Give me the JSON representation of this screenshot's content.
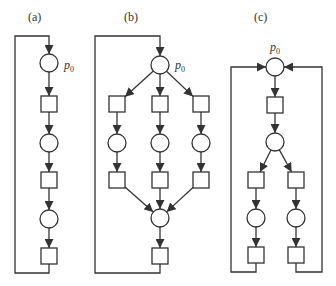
{
  "figure": {
    "stroke_color": "#333333",
    "fill_color": "#ffffff",
    "place_radius": 9,
    "transition_size": 16,
    "panels": [
      {
        "id": "a",
        "label": "(a)",
        "label_pos": [
          34,
          21
        ],
        "p0_label": {
          "base": "p",
          "sub": "0",
          "pos": [
            64,
            69
          ]
        },
        "places": [
          {
            "id": "p0",
            "cx": 49,
            "cy": 63
          },
          {
            "id": "p1",
            "cx": 49,
            "cy": 143
          },
          {
            "id": "p2",
            "cx": 49,
            "cy": 219
          }
        ],
        "transitions": [
          {
            "id": "t0",
            "cx": 49,
            "cy": 104
          },
          {
            "id": "t1",
            "cx": 49,
            "cy": 180
          },
          {
            "id": "t2",
            "cx": 49,
            "cy": 256
          }
        ],
        "arcs": [
          {
            "from": "p0",
            "to": "t0"
          },
          {
            "from": "t0",
            "to": "p1"
          },
          {
            "from": "p1",
            "to": "t1"
          },
          {
            "from": "t1",
            "to": "p2"
          },
          {
            "from": "p2",
            "to": "t2"
          }
        ],
        "loops": [
          {
            "points": [
              [
                49,
                264
              ],
              [
                49,
                273
              ],
              [
                15,
                273
              ],
              [
                15,
                36
              ],
              [
                49,
                36
              ],
              [
                49,
                54
              ]
            ]
          }
        ]
      },
      {
        "id": "b",
        "label": "(b)",
        "label_pos": [
          130,
          21
        ],
        "p0_label": {
          "base": "p",
          "sub": "0",
          "pos": [
            175,
            69
          ]
        },
        "places": [
          {
            "id": "p0",
            "cx": 160,
            "cy": 65
          },
          {
            "id": "p1",
            "cx": 117,
            "cy": 143
          },
          {
            "id": "p2",
            "cx": 160,
            "cy": 143
          },
          {
            "id": "p3",
            "cx": 201,
            "cy": 143
          },
          {
            "id": "p4",
            "cx": 160,
            "cy": 218
          }
        ],
        "transitions": [
          {
            "id": "t0",
            "cx": 117,
            "cy": 104
          },
          {
            "id": "t1",
            "cx": 160,
            "cy": 104
          },
          {
            "id": "t2",
            "cx": 201,
            "cy": 104
          },
          {
            "id": "t3",
            "cx": 117,
            "cy": 180
          },
          {
            "id": "t4",
            "cx": 160,
            "cy": 180
          },
          {
            "id": "t5",
            "cx": 201,
            "cy": 180
          },
          {
            "id": "t6",
            "cx": 160,
            "cy": 256
          }
        ],
        "arcs": [
          {
            "from": "p0",
            "to": "t0"
          },
          {
            "from": "p0",
            "to": "t1"
          },
          {
            "from": "p0",
            "to": "t2"
          },
          {
            "from": "t0",
            "to": "p1"
          },
          {
            "from": "t1",
            "to": "p2"
          },
          {
            "from": "t2",
            "to": "p3"
          },
          {
            "from": "p1",
            "to": "t3"
          },
          {
            "from": "p2",
            "to": "t4"
          },
          {
            "from": "p3",
            "to": "t5"
          },
          {
            "from": "t3",
            "to": "p4"
          },
          {
            "from": "t4",
            "to": "p4"
          },
          {
            "from": "t5",
            "to": "p4"
          },
          {
            "from": "p4",
            "to": "t6"
          }
        ],
        "loops": [
          {
            "points": [
              [
                160,
                264
              ],
              [
                160,
                273
              ],
              [
                95,
                273
              ],
              [
                95,
                36
              ],
              [
                160,
                36
              ],
              [
                160,
                56
              ]
            ]
          }
        ]
      },
      {
        "id": "c",
        "label": "(c)",
        "label_pos": [
          260,
          21
        ],
        "p0_label": {
          "base": "p",
          "sub": "0",
          "pos": [
            270,
            51
          ]
        },
        "places": [
          {
            "id": "p0",
            "cx": 275,
            "cy": 67
          },
          {
            "id": "p1",
            "cx": 275,
            "cy": 142
          },
          {
            "id": "p2",
            "cx": 256,
            "cy": 218
          },
          {
            "id": "p3",
            "cx": 296,
            "cy": 218
          }
        ],
        "transitions": [
          {
            "id": "t0",
            "cx": 275,
            "cy": 105
          },
          {
            "id": "t1",
            "cx": 256,
            "cy": 180
          },
          {
            "id": "t2",
            "cx": 296,
            "cy": 180
          },
          {
            "id": "t3",
            "cx": 256,
            "cy": 255
          },
          {
            "id": "t4",
            "cx": 296,
            "cy": 255
          }
        ],
        "arcs": [
          {
            "from": "p0",
            "to": "t0"
          },
          {
            "from": "t0",
            "to": "p1"
          },
          {
            "from": "p1",
            "to": "t1"
          },
          {
            "from": "p1",
            "to": "t2"
          },
          {
            "from": "t1",
            "to": "p2"
          },
          {
            "from": "t2",
            "to": "p3"
          },
          {
            "from": "p2",
            "to": "t3"
          },
          {
            "from": "p3",
            "to": "t4"
          }
        ],
        "loops": [
          {
            "points": [
              [
                256,
                263
              ],
              [
                256,
                272
              ],
              [
                231,
                272
              ],
              [
                231,
                67
              ],
              [
                266,
                67
              ]
            ]
          },
          {
            "points": [
              [
                296,
                263
              ],
              [
                296,
                272
              ],
              [
                322,
                272
              ],
              [
                322,
                67
              ],
              [
                284,
                67
              ]
            ]
          }
        ]
      }
    ]
  }
}
